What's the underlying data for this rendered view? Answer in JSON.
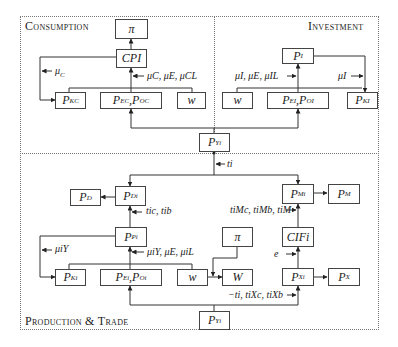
{
  "regions": {
    "consumption": {
      "title": "Consumption"
    },
    "investment": {
      "title": "Investment"
    },
    "production_trade": {
      "title": "Production & Trade"
    }
  },
  "consumption": {
    "pi": "π",
    "cpi": "CPI",
    "p_c_k": {
      "base": "P",
      "sup": "K",
      "sub": "C"
    },
    "p_c_eo": {
      "base1": "P",
      "sup1": "E",
      "sub1": "C",
      "sep": ", ",
      "base2": "P",
      "sup2": "O",
      "sub2": "C"
    },
    "w": "w",
    "label_mu_c": "μ",
    "label_mu_c_sub": "C",
    "label_params": "μC, μE, μCL"
  },
  "investment": {
    "p_i": {
      "base": "P",
      "sup": "I"
    },
    "w": "w",
    "p_i_eo": {
      "base1": "P",
      "sup1": "E",
      "sub1": "I",
      "sep": ", ",
      "base2": "P",
      "sup2": "O",
      "sub2": "I"
    },
    "p_i_k": {
      "base": "P",
      "sup": "K",
      "sub": "I"
    },
    "label_params": "μI, μE, μIL",
    "label_mu_i": "μI"
  },
  "link": {
    "p_y_top": {
      "base": "P",
      "sup": "Y",
      "sub": "i"
    },
    "label_t": "ti"
  },
  "production_trade": {
    "p_d_agg": {
      "base": "P",
      "sup": "D"
    },
    "p_d": {
      "base": "P",
      "sup": "D",
      "sub": "i"
    },
    "p_m": {
      "base": "P",
      "sup": "M",
      "sub": "i"
    },
    "p_m_agg": {
      "base": "P",
      "sup": "M"
    },
    "label_tcb": "tic, tib",
    "label_tm": "tiMc, tiMb, tiM",
    "p_p": {
      "base": "P",
      "sup": "P",
      "sub": "i"
    },
    "pi": "π",
    "cif": "CIFi",
    "label_mu_y": "μiY",
    "label_params": "μiY, μE, μiL",
    "label_e": "e",
    "p_k": {
      "base": "P",
      "sup": "K",
      "sub": "i"
    },
    "p_eo": {
      "base1": "P",
      "sup1": "E",
      "sub1": "i",
      "sep": ", ",
      "base2": "P",
      "sup2": "O",
      "sub2": "i"
    },
    "w": "w",
    "W": "W",
    "p_x": {
      "base": "P",
      "sup": "X",
      "sub": "i"
    },
    "p_x_agg": {
      "base": "P",
      "sup": "X"
    },
    "label_tx": "−ti, tiXc, tiXb",
    "p_y_bottom": {
      "base": "P",
      "sup": "Y",
      "sub": "i"
    }
  }
}
